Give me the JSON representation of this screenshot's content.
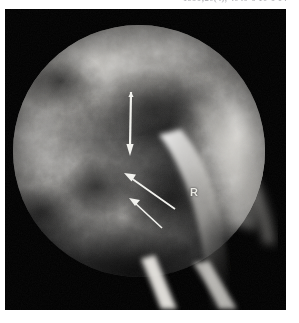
{
  "page": {
    "running_head": "1996;20(4), 4040-6 10-6 14",
    "background_color": "#ffffff"
  },
  "figure": {
    "name": "fluoroscopic-radiograph",
    "modality_note": "fluoroscopic spot radiograph of the pelvis / hip",
    "plate": {
      "background_color": "#000000",
      "x": 5,
      "y": 9,
      "width": 281,
      "height": 301
    },
    "fluoro_field": {
      "shape": "circle",
      "center_x": 134,
      "center_y": 142,
      "radius": 126,
      "rim_color": "#000000"
    },
    "annotations": [
      {
        "id": "arrow-vertical",
        "type": "arrow",
        "label": "needle-tract-arrow",
        "color": "#f2f2ee",
        "tail_x": 131,
        "tail_y": 92,
        "tip_x": 130,
        "tip_y": 152,
        "direction": "down"
      },
      {
        "id": "arrow-diagonal-upper",
        "type": "arrow",
        "label": "lesion-arrow-upper",
        "color": "#f2f2ee",
        "tail_x": 173,
        "tail_y": 208,
        "tip_x": 126,
        "tip_y": 172,
        "direction": "up-left"
      },
      {
        "id": "arrow-diagonal-lower",
        "type": "arrow",
        "label": "lesion-arrow-lower",
        "color": "#f2f2ee",
        "tail_x": 160,
        "tail_y": 227,
        "tip_x": 131,
        "tip_y": 199,
        "direction": "up-left"
      }
    ],
    "side_marker": {
      "text": "R",
      "color": "#e8e8e2",
      "x": 185,
      "y": 178
    }
  }
}
